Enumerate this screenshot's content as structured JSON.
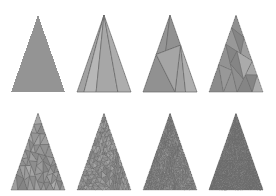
{
  "figure": {
    "name": "triangle-mesh-refinement-sequence",
    "background_color": "#ffffff",
    "width": 276,
    "height": 196,
    "rows": 2,
    "columns": 4,
    "panel_count": 8,
    "stroke_color": "#6b6b6b",
    "palette": [
      "#8f8f8f",
      "#a8a8a8",
      "#bdbdbd",
      "#d2d2d2",
      "#7c7c7c",
      "#9a9a9a",
      "#b2b2b2",
      "#c8c8c8",
      "#6e6e6e",
      "#868686"
    ]
  },
  "chart_data": {
    "type": "diagram",
    "title": "",
    "subtitle": "",
    "xlabel": "",
    "ylabel": "",
    "panels": [
      {
        "index": 1,
        "label": "",
        "subdivision_level": 0,
        "triangle_count": 1,
        "apex": [
          38,
          15
        ],
        "left": [
          11,
          92
        ],
        "right": [
          65,
          92
        ],
        "mean_gray": "#949494"
      },
      {
        "index": 2,
        "label": "",
        "subdivision_level": 1,
        "triangle_count": 4,
        "apex": [
          104,
          15
        ],
        "left": [
          77,
          92
        ],
        "right": [
          131,
          92
        ],
        "mean_gray": "#9c9c9c"
      },
      {
        "index": 3,
        "label": "",
        "subdivision_level": 2,
        "triangle_count": 11,
        "apex": [
          170,
          15
        ],
        "left": [
          143,
          92
        ],
        "right": [
          197,
          92
        ],
        "mean_gray": "#9a9a9a"
      },
      {
        "index": 4,
        "label": "",
        "subdivision_level": 3,
        "triangle_count": 28,
        "apex": [
          236,
          15
        ],
        "left": [
          209,
          92
        ],
        "right": [
          263,
          92
        ],
        "mean_gray": "#969696"
      },
      {
        "index": 5,
        "label": "",
        "subdivision_level": 4,
        "triangle_count": 72,
        "apex": [
          38,
          113
        ],
        "left": [
          11,
          190
        ],
        "right": [
          65,
          190
        ],
        "mean_gray": "#939393"
      },
      {
        "index": 6,
        "label": "",
        "subdivision_level": 5,
        "triangle_count": 200,
        "apex": [
          104,
          113
        ],
        "left": [
          77,
          190
        ],
        "right": [
          131,
          190
        ],
        "mean_gray": "#8d8d8d"
      },
      {
        "index": 7,
        "label": "",
        "subdivision_level": 6,
        "triangle_count": 450,
        "apex": [
          170,
          113
        ],
        "left": [
          143,
          190
        ],
        "right": [
          197,
          190
        ],
        "mean_gray": "#858585"
      },
      {
        "index": 8,
        "label": "",
        "subdivision_level": 7,
        "triangle_count": 800,
        "apex": [
          236,
          113
        ],
        "left": [
          209,
          190
        ],
        "right": [
          263,
          190
        ],
        "mean_gray": "#7c7c7c"
      }
    ]
  }
}
